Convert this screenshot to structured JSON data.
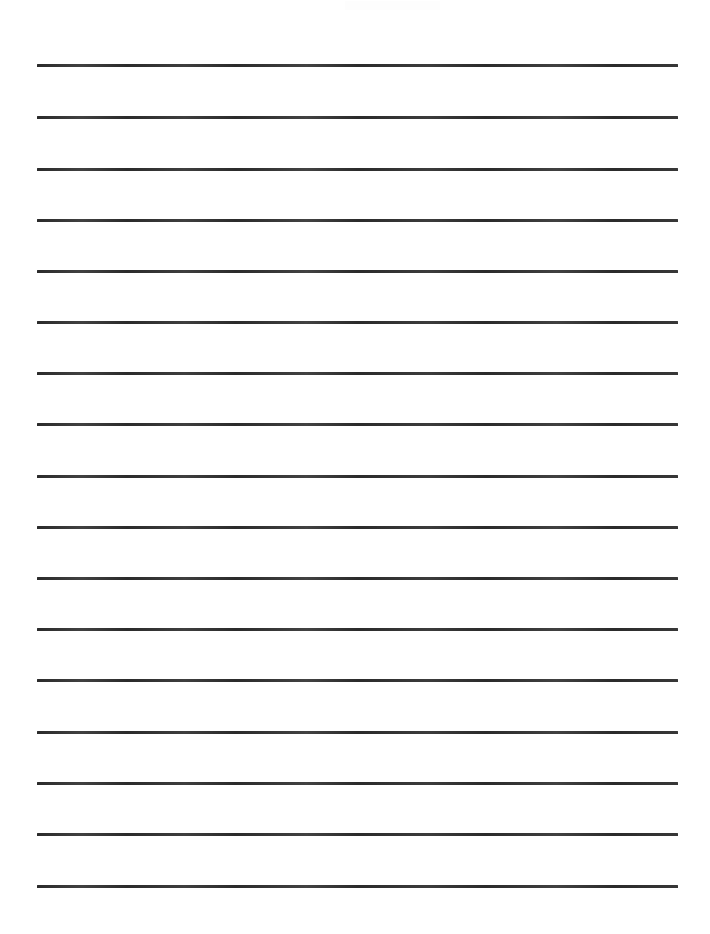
{
  "document": {
    "kind": "lined-writing-paper",
    "title": "",
    "page_width": 710,
    "page_height": 934,
    "background_color": "#ffffff",
    "rule_color": "#2b2b2b",
    "rule_thickness_px": 3,
    "rule_left_x": 37,
    "rule_right_x": 678,
    "rule_length_px": 641,
    "rule_count": 17,
    "rule_spacing_px": 51,
    "top_margin_px": 52,
    "bottom_margin_px": 44,
    "left_margin_px": 37,
    "right_margin_px": 32,
    "body_text": "",
    "header_text": "",
    "footer_text": "",
    "page_number": ""
  },
  "rules": [
    {
      "index": 1,
      "y": 64,
      "label": "ruled-line-1"
    },
    {
      "index": 2,
      "y": 116,
      "label": "ruled-line-2"
    },
    {
      "index": 3,
      "y": 168,
      "label": "ruled-line-3"
    },
    {
      "index": 4,
      "y": 219,
      "label": "ruled-line-4"
    },
    {
      "index": 5,
      "y": 270,
      "label": "ruled-line-5"
    },
    {
      "index": 6,
      "y": 321,
      "label": "ruled-line-6"
    },
    {
      "index": 7,
      "y": 372,
      "label": "ruled-line-7"
    },
    {
      "index": 8,
      "y": 423,
      "label": "ruled-line-8"
    },
    {
      "index": 9,
      "y": 475,
      "label": "ruled-line-9"
    },
    {
      "index": 10,
      "y": 526,
      "label": "ruled-line-10"
    },
    {
      "index": 11,
      "y": 577,
      "label": "ruled-line-11"
    },
    {
      "index": 12,
      "y": 628,
      "label": "ruled-line-12"
    },
    {
      "index": 13,
      "y": 679,
      "label": "ruled-line-13"
    },
    {
      "index": 14,
      "y": 731,
      "label": "ruled-line-14"
    },
    {
      "index": 15,
      "y": 782,
      "label": "ruled-line-15"
    },
    {
      "index": 16,
      "y": 833,
      "label": "ruled-line-16"
    },
    {
      "index": 17,
      "y": 885,
      "label": "ruled-line-17"
    }
  ],
  "writing_rows": [
    {
      "index": 1,
      "content": ""
    },
    {
      "index": 2,
      "content": ""
    },
    {
      "index": 3,
      "content": ""
    },
    {
      "index": 4,
      "content": ""
    },
    {
      "index": 5,
      "content": ""
    },
    {
      "index": 6,
      "content": ""
    },
    {
      "index": 7,
      "content": ""
    },
    {
      "index": 8,
      "content": ""
    },
    {
      "index": 9,
      "content": ""
    },
    {
      "index": 10,
      "content": ""
    },
    {
      "index": 11,
      "content": ""
    },
    {
      "index": 12,
      "content": ""
    },
    {
      "index": 13,
      "content": ""
    },
    {
      "index": 14,
      "content": ""
    },
    {
      "index": 15,
      "content": ""
    },
    {
      "index": 16,
      "content": ""
    },
    {
      "index": 17,
      "content": ""
    }
  ]
}
